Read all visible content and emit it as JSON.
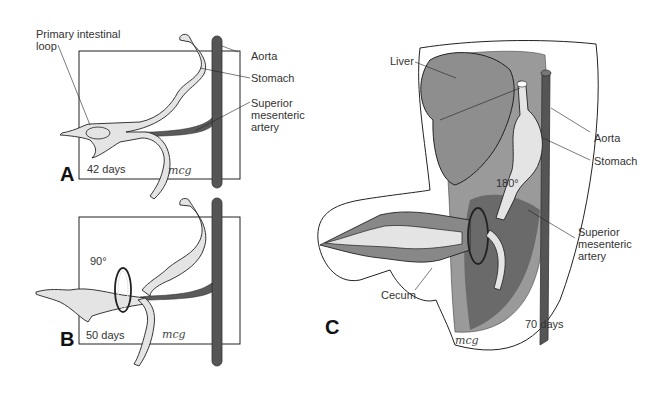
{
  "figure": {
    "panels": [
      {
        "id": "A",
        "age": "42 days",
        "signature": "mcg",
        "labels": [
          "Primary intestinal loop",
          "Aorta",
          "Stomach",
          "Superior mesenteric artery"
        ]
      },
      {
        "id": "B",
        "age": "50 days",
        "rotation": "90°",
        "signature": "mcg"
      },
      {
        "id": "C",
        "age": "70 days",
        "rotation": "180°",
        "signature": "mcg",
        "labels": [
          "Liver",
          "Aorta",
          "Stomach",
          "Superior mesenteric artery",
          "Cecum"
        ]
      }
    ]
  },
  "A": {
    "letter": "A",
    "days": "42 days",
    "sig": "mcg",
    "loop_line1": "Primary intestinal",
    "loop_line2": "loop",
    "aorta": "Aorta",
    "stomach": "Stomach",
    "sma_line1": "Superior",
    "sma_line2": "mesenteric",
    "sma_line3": "artery"
  },
  "B": {
    "letter": "B",
    "days": "50 days",
    "angle": "90°",
    "sig": "mcg"
  },
  "C": {
    "letter": "C",
    "days": "70 days",
    "angle": "180°",
    "sig": "mcg",
    "liver": "Liver",
    "aorta": "Aorta",
    "stomach": "Stomach",
    "sma_line1": "Superior",
    "sma_line2": "mesenteric",
    "sma_line3": "artery",
    "cecum": "Cecum"
  },
  "colors": {
    "aorta": "#555555",
    "organ_light": "#e4e4e4",
    "liver": "#8e8e8e",
    "cavity": "#6a6a6a",
    "outline": "#222222"
  }
}
